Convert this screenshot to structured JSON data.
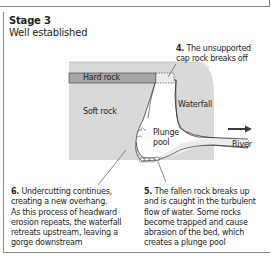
{
  "previous_stage": {
    "caption_fragment": "the fall of water"
  },
  "stage": {
    "title": "Stage 3",
    "subtitle": "Well established"
  },
  "diagram": {
    "labels": {
      "hard_rock": "Hard rock",
      "soft_rock": "Soft rock",
      "waterfall": "Waterfall",
      "plunge_pool_line1": "Plunge",
      "plunge_pool_line2": "pool",
      "river": "River"
    },
    "flow_direction": "right-arrow",
    "colors": {
      "rock_fill": "#d9d9d9",
      "hard_rock_fill": "#a6a6a6",
      "water_fill": "#ffffff",
      "river_fill": "#ececec",
      "outline": "#3a3a3a",
      "border": "#8a8a8a"
    }
  },
  "annotations": [
    {
      "number": "4.",
      "lines": [
        "The unsupported",
        "cap rock breaks off"
      ]
    },
    {
      "number": "5.",
      "lines": [
        "The fallen rock breaks up",
        "and is caught in the turbulent",
        "flow of water. Some rocks",
        "become trapped and cause",
        "abrasion of the bed, which",
        "creates a plunge pool"
      ]
    },
    {
      "number": "6.",
      "lines": [
        "Undercutting continues,",
        "creating a new overhang.",
        "As this process of headward",
        "erosion repeats, the waterfall",
        "retreats upstream, leaving a",
        "gorge downstream"
      ]
    }
  ]
}
